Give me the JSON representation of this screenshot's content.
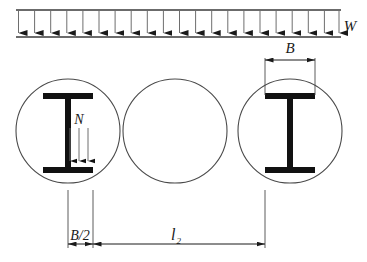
{
  "figure": {
    "background_color": "#ffffff",
    "line_color": "#2b2b2b",
    "beam_color": "#111111",
    "thin_line_color": "#555555",
    "labels": {
      "load_label": "W",
      "flange_width_label": "B",
      "point_load_label": "N",
      "half_flange_label": "B/2",
      "spacing_label": "l",
      "spacing_subscript": "2"
    },
    "load_band": {
      "top_line_y": 10,
      "bottom_line_y": 37,
      "x_start": 16,
      "x_end": 341,
      "arrow_count": 21,
      "arrow_direction": "down"
    },
    "circles": [
      {
        "cx": 68,
        "cy": 131,
        "r": 52
      },
      {
        "cx": 175,
        "cy": 131,
        "r": 52
      },
      {
        "cx": 290,
        "cy": 131,
        "r": 52
      }
    ],
    "beams": [
      {
        "name": "left-i-beam",
        "center_x": 68,
        "flange_left": 43,
        "flange_right": 93,
        "top_flange_y": 93,
        "bottom_flange_y": 170,
        "flange_thickness": 6,
        "web_thickness": 6
      },
      {
        "name": "right-i-beam",
        "center_x": 290,
        "flange_left": 265,
        "flange_right": 315,
        "top_flange_y": 93,
        "bottom_flange_y": 170,
        "flange_thickness": 6,
        "web_thickness": 6
      }
    ],
    "point_load_arrows": {
      "count": 3,
      "x_positions": [
        70,
        79,
        88
      ],
      "y_start": 128,
      "y_end": 168
    },
    "dimensions": [
      {
        "name": "flange-width-B",
        "label": "B",
        "y": 60,
        "x_start": 265,
        "x_end": 315,
        "extension_top": 58,
        "extension_bottom": 95
      },
      {
        "name": "half-flange-B-over-2",
        "label": "B/2",
        "y": 244,
        "x_start": 68,
        "x_end": 93,
        "extension_top": 190,
        "extension_bottom": 248
      },
      {
        "name": "beam-spacing-l2",
        "label": "l",
        "sublabel": "2",
        "y": 244,
        "x_start": 93,
        "x_end": 265,
        "extension_top": 190,
        "extension_bottom": 248
      }
    ]
  }
}
